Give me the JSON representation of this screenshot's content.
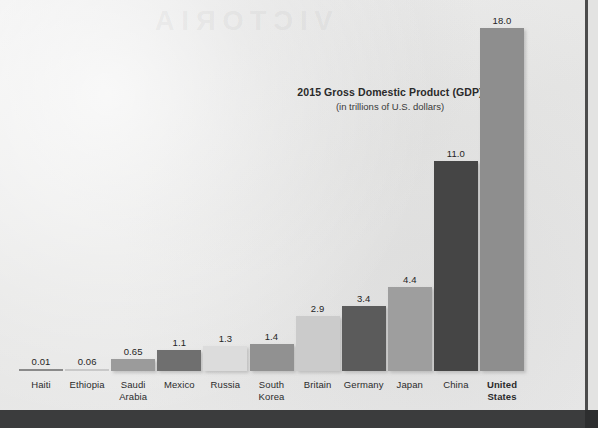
{
  "chart_data": {
    "type": "bar",
    "title": "2015 Gross Domestic Product (GDP)",
    "subtitle": "(in trillions of U.S. dollars)",
    "xlabel": "",
    "ylabel": "",
    "ylim": [
      0,
      18
    ],
    "grid": false,
    "legend": "none",
    "value_label_format": "as-printed",
    "categories": [
      "Haiti",
      "Ethiopia",
      "Saudi Arabia",
      "Mexico",
      "Russia",
      "South Korea",
      "Britain",
      "Germany",
      "Japan",
      "China",
      "United States"
    ],
    "values": [
      0.01,
      0.06,
      0.65,
      1.1,
      1.3,
      1.4,
      2.9,
      3.4,
      4.4,
      11.0,
      18.0
    ],
    "value_labels": [
      "0.01",
      "0.06",
      "0.65",
      "1.1",
      "1.3",
      "1.4",
      "2.9",
      "3.4",
      "4.4",
      "11.0",
      "18.0"
    ],
    "bars": [
      {
        "category": "Haiti",
        "label_line1": "Haiti",
        "label_line2": "",
        "value": 0.01,
        "value_label": "0.01",
        "color": "#8a8a8a",
        "bold_label": false
      },
      {
        "category": "Ethiopia",
        "label_line1": "Ethiopia",
        "label_line2": "",
        "value": 0.06,
        "value_label": "0.06",
        "color": "#c9c9c9",
        "bold_label": false
      },
      {
        "category": "Saudi Arabia",
        "label_line1": "Saudi",
        "label_line2": "Arabia",
        "value": 0.65,
        "value_label": "0.65",
        "color": "#9b9b9b",
        "bold_label": false
      },
      {
        "category": "Mexico",
        "label_line1": "Mexico",
        "label_line2": "",
        "value": 1.1,
        "value_label": "1.1",
        "color": "#6f6f6f",
        "bold_label": false
      },
      {
        "category": "Russia",
        "label_line1": "Russia",
        "label_line2": "",
        "value": 1.3,
        "value_label": "1.3",
        "color": "#dcdcdc",
        "bold_label": false
      },
      {
        "category": "South Korea",
        "label_line1": "South",
        "label_line2": "Korea",
        "value": 1.4,
        "value_label": "1.4",
        "color": "#919191",
        "bold_label": false
      },
      {
        "category": "Britain",
        "label_line1": "Britain",
        "label_line2": "",
        "value": 2.9,
        "value_label": "2.9",
        "color": "#cbcbcb",
        "bold_label": false
      },
      {
        "category": "Germany",
        "label_line1": "Germany",
        "label_line2": "",
        "value": 3.4,
        "value_label": "3.4",
        "color": "#5b5b5b",
        "bold_label": false
      },
      {
        "category": "Japan",
        "label_line1": "Japan",
        "label_line2": "",
        "value": 4.4,
        "value_label": "4.4",
        "color": "#9e9e9e",
        "bold_label": false
      },
      {
        "category": "China",
        "label_line1": "China",
        "label_line2": "",
        "value": 11.0,
        "value_label": "11.0",
        "color": "#454545",
        "bold_label": false
      },
      {
        "category": "United States",
        "label_line1": "United",
        "label_line2": "States",
        "value": 18.0,
        "value_label": "18.0",
        "color": "#8e8e8e",
        "bold_label": true
      }
    ]
  },
  "page": {
    "background_color": "#e9e9e8",
    "gutter_color": "#4c4c4c",
    "band_color": "#3b3c3d",
    "ghost_text": "VICTORIA"
  }
}
